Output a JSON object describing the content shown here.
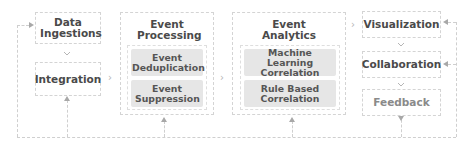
{
  "diagram": {
    "data_ingestions": "Data Ingestions",
    "integration": "Integration",
    "event_processing": {
      "title": "Event Processing",
      "items": [
        "Event Deduplication",
        "Event Suppression"
      ]
    },
    "event_analytics": {
      "title": "Event Analytics",
      "items": [
        "Machine Learning Correlation",
        "Rule Based Correlation"
      ]
    },
    "visualization": "Visualization",
    "collaboration": "Collaboration",
    "feedback": "Feedback",
    "separator_glyph": "›",
    "colors": {
      "text": "#4a4a4a",
      "feedback_text": "#8a8a8a",
      "chip_bg": "#e6e6e6",
      "border": "#d4d4d4",
      "arrow": "#a8a8a8"
    }
  }
}
